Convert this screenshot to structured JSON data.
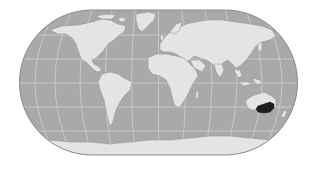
{
  "map": {
    "projection": "pseudo-cylindrical world (Eckert IV style)",
    "colors": {
      "background": "#ffffff",
      "ocean": "#a9a9a9",
      "land": "#e4e4e4",
      "coast": "#8c8c8c",
      "graticule": "#d8d8d8",
      "border": "#8a8a8a",
      "highlight": "#1e1e1e"
    },
    "frame": {
      "cx": 158.5,
      "cy": 82.5,
      "left": 20,
      "right": 297,
      "top": 10,
      "bottom": 155
    },
    "highlighted_region": {
      "name": "South-eastern Australia",
      "color": "#1e1e1e"
    },
    "layers": [
      "ocean",
      "graticule",
      "land",
      "highlighted-region",
      "frame"
    ]
  }
}
